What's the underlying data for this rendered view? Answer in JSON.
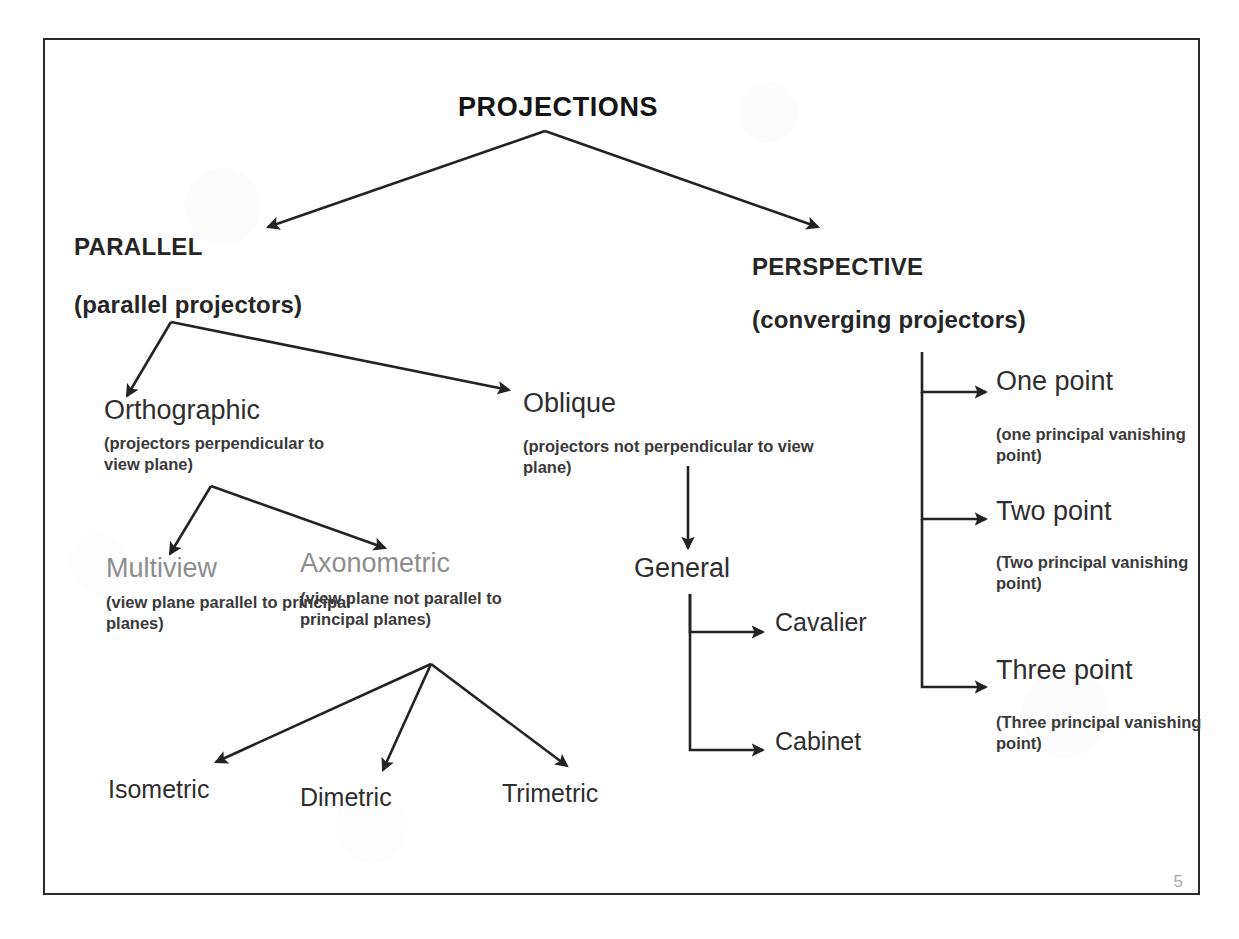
{
  "slide": {
    "page_number": "5",
    "border_color": "#2a2a2a",
    "text_color": "#2e2e2e",
    "muted_color": "#8d8d8d"
  },
  "diagram": {
    "type": "tree",
    "root": "PROJECTIONS",
    "nodes": {
      "root": {
        "label": "PROJECTIONS"
      },
      "parallel": {
        "label": "PARALLEL",
        "paren": "(parallel projectors)"
      },
      "perspective": {
        "label": "PERSPECTIVE",
        "paren": "(converging projectors)"
      },
      "orthographic": {
        "label": "Orthographic",
        "sub": "(projectors perpendicular to view plane)"
      },
      "oblique": {
        "label": "Oblique",
        "sub": "(projectors not perpendicular to view plane)"
      },
      "multiview": {
        "label": "Multiview",
        "sub": "(view plane parallel to principal planes)"
      },
      "axonometric": {
        "label": "Axonometric",
        "sub": "(view plane not parallel to principal planes)"
      },
      "isometric": {
        "label": "Isometric"
      },
      "dimetric": {
        "label": "Dimetric"
      },
      "trimetric": {
        "label": "Trimetric"
      },
      "general": {
        "label": "General"
      },
      "cavalier": {
        "label": "Cavalier"
      },
      "cabinet": {
        "label": "Cabinet"
      },
      "one_point": {
        "label": "One point",
        "sub": "(one principal vanishing point)"
      },
      "two_point": {
        "label": "Two point",
        "sub": "(Two principal vanishing point)"
      },
      "three_point": {
        "label": "Three point",
        "sub": "(Three principal vanishing point)"
      }
    },
    "edges": [
      {
        "from": "root",
        "to": "parallel"
      },
      {
        "from": "root",
        "to": "perspective"
      },
      {
        "from": "parallel",
        "to": "orthographic"
      },
      {
        "from": "parallel",
        "to": "oblique"
      },
      {
        "from": "orthographic",
        "to": "multiview"
      },
      {
        "from": "orthographic",
        "to": "axonometric"
      },
      {
        "from": "axonometric",
        "to": "isometric"
      },
      {
        "from": "axonometric",
        "to": "dimetric"
      },
      {
        "from": "axonometric",
        "to": "trimetric"
      },
      {
        "from": "oblique",
        "to": "general"
      },
      {
        "from": "general",
        "to": "cavalier"
      },
      {
        "from": "general",
        "to": "cabinet"
      },
      {
        "from": "perspective",
        "to": "one_point"
      },
      {
        "from": "perspective",
        "to": "two_point"
      },
      {
        "from": "perspective",
        "to": "three_point"
      }
    ]
  }
}
